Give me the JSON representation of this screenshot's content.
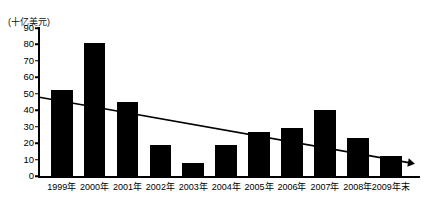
{
  "chart_data": {
    "type": "bar",
    "title": "",
    "subtitle": "",
    "xlabel": "",
    "ylabel": "(十亿美元)",
    "unit_label": "(十亿美元)",
    "categories": [
      "1999年",
      "2000年",
      "2001年",
      "2002年",
      "2003年",
      "2004年",
      "2005年",
      "2006年",
      "2007年",
      "2008年",
      "2009年末"
    ],
    "values": [
      52,
      81,
      45,
      19,
      8,
      19,
      27,
      29,
      40,
      23,
      12
    ],
    "series": [
      {
        "name": "",
        "values": [
          52,
          81,
          45,
          19,
          8,
          19,
          27,
          29,
          40,
          23,
          12
        ]
      }
    ],
    "ylim": [
      0,
      90
    ],
    "yticks": [
      0,
      10,
      20,
      30,
      40,
      50,
      60,
      70,
      80,
      90
    ],
    "ytick_labels": [
      "0",
      "10",
      "20",
      "30",
      "40",
      "50",
      "60",
      "70",
      "80",
      "90"
    ],
    "grid": false,
    "legend": false,
    "legend_position": "none",
    "bar_color": "#000000",
    "axis_color": "#000000",
    "background_color": "#ffffff",
    "annotations": [
      {
        "name": "trend-line",
        "type": "line-with-arrow",
        "start_value": 48,
        "end_value": 8,
        "color": "#000000",
        "direction": "downward"
      }
    ]
  }
}
